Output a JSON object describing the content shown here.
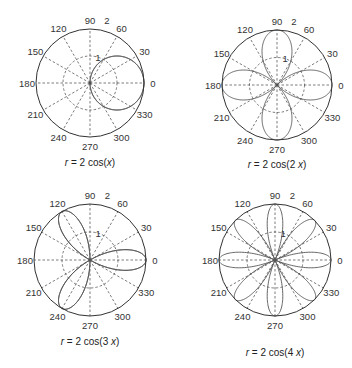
{
  "header": {
    "cut_title": ""
  },
  "style": {
    "axis_color": "#333333",
    "grid_color": "#444444",
    "curve_color": "#555555",
    "background": "#ffffff"
  },
  "chart_data": [
    {
      "type": "line",
      "subtype": "polar",
      "title": "r = 2 cos(x)",
      "caption_parts": [
        "r",
        " = 2 cos(",
        "x",
        ")"
      ],
      "equation": {
        "a": 2,
        "n": 1
      },
      "rlim": [
        0,
        2
      ],
      "r_ticks": [
        1,
        2
      ],
      "theta_ticks": [
        0,
        30,
        60,
        90,
        120,
        150,
        180,
        210,
        240,
        270,
        300,
        330
      ],
      "grid": true,
      "layout": {
        "cx": 90,
        "cy": 83,
        "R": 54,
        "caption_x": 90,
        "caption_y": 166
      }
    },
    {
      "type": "line",
      "subtype": "polar",
      "title": "r = 2 cos(2 x)",
      "caption_parts": [
        "r",
        " = 2 cos(2 ",
        "x",
        ")"
      ],
      "equation": {
        "a": 2,
        "n": 2
      },
      "rlim": [
        0,
        2
      ],
      "r_ticks": [
        1,
        2
      ],
      "theta_ticks": [
        0,
        30,
        60,
        90,
        120,
        150,
        180,
        210,
        240,
        270,
        300,
        330
      ],
      "grid": true,
      "layout": {
        "cx": 277,
        "cy": 85,
        "R": 55,
        "caption_x": 277,
        "caption_y": 168
      }
    },
    {
      "type": "line",
      "subtype": "polar",
      "title": "r = 2 cos(3 x)",
      "caption_parts": [
        "r",
        " = 2 cos(3 ",
        "x",
        ")"
      ],
      "equation": {
        "a": 2,
        "n": 3
      },
      "rlim": [
        0,
        2
      ],
      "r_ticks": [
        1,
        2
      ],
      "theta_ticks": [
        0,
        30,
        60,
        90,
        120,
        150,
        180,
        210,
        240,
        270,
        300,
        330
      ],
      "grid": true,
      "layout": {
        "cx": 90,
        "cy": 260,
        "R": 56,
        "caption_x": 90,
        "caption_y": 345
      }
    },
    {
      "type": "line",
      "subtype": "polar",
      "title": "r = 2 cos(4 x)",
      "caption_parts": [
        "r",
        " = 2 cos(4 ",
        "x",
        ")"
      ],
      "equation": {
        "a": 2,
        "n": 4
      },
      "rlim": [
        0,
        2
      ],
      "r_ticks": [
        1,
        2
      ],
      "theta_ticks": [
        0,
        30,
        60,
        90,
        120,
        150,
        180,
        210,
        240,
        270,
        300,
        330
      ],
      "grid": true,
      "layout": {
        "cx": 275,
        "cy": 260,
        "R": 56,
        "caption_x": 275,
        "caption_y": 356
      }
    }
  ]
}
